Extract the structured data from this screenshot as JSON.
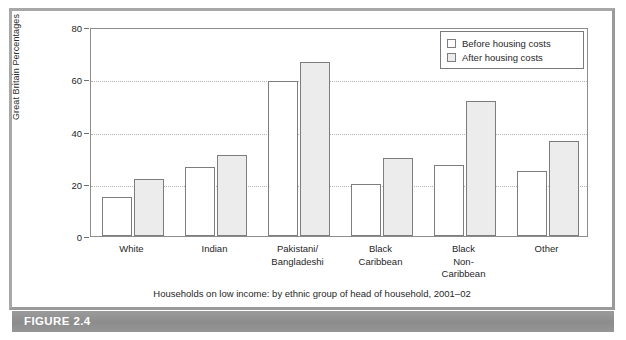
{
  "figure": {
    "band_label": "FIGURE 2.4",
    "caption": "Households on low income: by ethnic group of head of household, 2001–02"
  },
  "legend": {
    "items": [
      {
        "label": "Before housing costs",
        "swatch": "white-square-icon",
        "color": "#ffffff"
      },
      {
        "label": "After housing costs",
        "swatch": "gray-square-icon",
        "color": "#ececec"
      }
    ]
  },
  "axes": {
    "y_title": "Great Britain Percentages",
    "y_ticks": [
      "0",
      "20",
      "40",
      "60",
      "80"
    ]
  },
  "chart_data": {
    "type": "bar",
    "title": "",
    "subtitle": "",
    "xlabel": "",
    "ylabel": "Great Britain Percentages",
    "ylim": [
      0,
      80
    ],
    "yticks": [
      0,
      20,
      40,
      60,
      80
    ],
    "grid": true,
    "legend_position": "top-right",
    "categories": [
      "White",
      "Pakistani/\nBangladeshi",
      "Indian",
      "Black\nCaribbean",
      "Black\nNon-\nCaribbean",
      "Other"
    ],
    "category_order": [
      "White",
      "Indian",
      "Pakistani/\nBangladeshi",
      "Black\nCaribbean",
      "Black\nNon-\nCaribbean",
      "Other"
    ],
    "series": [
      {
        "name": "Before housing costs",
        "color": "#ffffff",
        "values": [
          15,
          26.5,
          59.5,
          20,
          27,
          25
        ]
      },
      {
        "name": "After housing costs",
        "color": "#ececec",
        "values": [
          22,
          31,
          66.5,
          30,
          51.5,
          36.5
        ]
      }
    ],
    "annotations": [
      "Households on low income: by ethnic group of head of household, 2001–02"
    ]
  }
}
